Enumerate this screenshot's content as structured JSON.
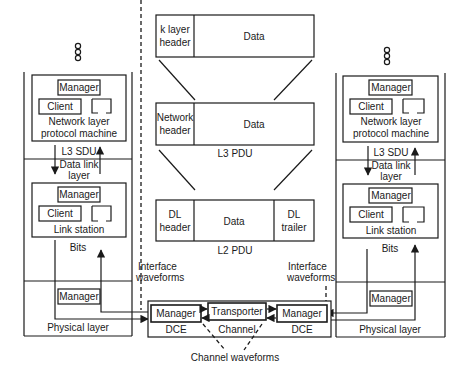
{
  "diagram": {
    "left_stack": {
      "ellipsis": "ooo",
      "network_layer": {
        "manager": "Manager",
        "client": "Client",
        "title_line1": "Network layer",
        "title_line2": "protocol machine"
      },
      "l3_sdu": "L3 SDU",
      "data_link_label_line1": "Data link",
      "data_link_label_line2": "layer",
      "link_station": {
        "manager": "Manager",
        "client": "Client",
        "title": "Link station"
      },
      "bits": "Bits",
      "physical": {
        "manager": "Manager",
        "title": "Physical layer"
      }
    },
    "right_stack": {
      "ellipsis": "ooo",
      "network_layer": {
        "manager": "Manager",
        "client": "Client",
        "title_line1": "Network layer",
        "title_line2": "protocol machine"
      },
      "l3_sdu": "L3 SDU",
      "data_link_label_line1": "Data link",
      "data_link_label_line2": "layer",
      "link_station": {
        "manager": "Manager",
        "client": "Client",
        "title": "Link station"
      },
      "bits": "Bits",
      "physical": {
        "manager": "Manager",
        "title": "Physical layer"
      }
    },
    "pdus": {
      "k_layer": {
        "header_line1": "k layer",
        "header_line2": "header",
        "data": "Data"
      },
      "l3": {
        "header_line1": "Network",
        "header_line2": "header",
        "data": "Data",
        "caption": "L3 PDU"
      },
      "l2": {
        "header_line1": "DL",
        "header_line2": "header",
        "data": "Data",
        "trailer_line1": "DL",
        "trailer_line2": "trailer",
        "caption": "L2 PDU"
      }
    },
    "channel": {
      "left_manager": "Manager",
      "transporter": "Transporter",
      "right_manager": "Manager",
      "left_dce": "DCE",
      "channel_label": "Channel",
      "right_dce": "DCE",
      "channel_waveforms": "Channel waveforms"
    },
    "interface_left": {
      "line1": "Interface",
      "line2": "waveforms"
    },
    "interface_right": {
      "line1": "Interface",
      "line2": "waveforms"
    }
  }
}
